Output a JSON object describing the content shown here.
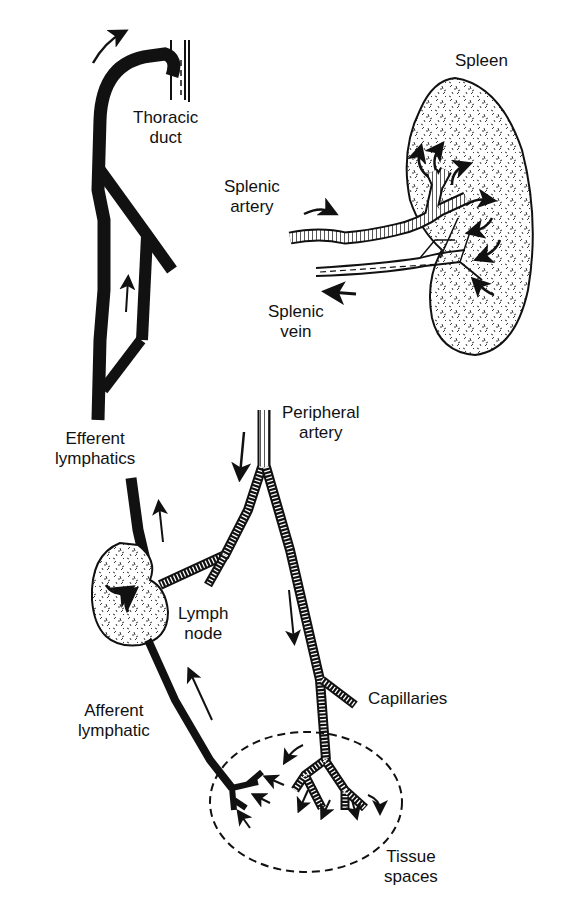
{
  "diagram": {
    "colors": {
      "ink": "#111111",
      "background": "#ffffff"
    },
    "labels": {
      "thoracic_duct": {
        "line1": "Thoracic",
        "line2": "duct"
      },
      "spleen": {
        "line1": "Spleen"
      },
      "splenic_artery": {
        "line1": "Splenic",
        "line2": "artery"
      },
      "splenic_vein": {
        "line1": "Splenic",
        "line2": "vein"
      },
      "peripheral_artery": {
        "line1": "Peripheral",
        "line2": "artery"
      },
      "efferent_lymphatics": {
        "line1": "Efferent",
        "line2": "lymphatics"
      },
      "lymph_node": {
        "line1": "Lymph",
        "line2": "node"
      },
      "capillaries": {
        "line1": "Capillaries"
      },
      "afferent_lymphatic": {
        "line1": "Afferent",
        "line2": "lymphatic"
      },
      "tissue_spaces": {
        "line1": "Tissue",
        "line2": "spaces"
      }
    },
    "structures": [
      "thoracic-duct",
      "efferent-lymphatic-trunk",
      "lymph-node",
      "afferent-lymphatic",
      "peripheral-artery",
      "capillaries",
      "tissue-spaces",
      "spleen",
      "splenic-artery",
      "splenic-vein"
    ]
  }
}
